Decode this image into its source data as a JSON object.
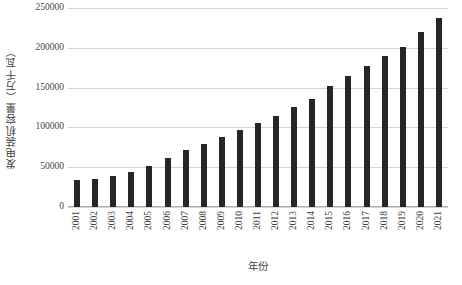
{
  "chart_data": {
    "type": "bar",
    "title": "",
    "xlabel": "年份",
    "ylabel": "发电装机容量（万千瓦）",
    "categories": [
      "2001",
      "2002",
      "2003",
      "2004",
      "2005",
      "2006",
      "2007",
      "2008",
      "2009",
      "2010",
      "2011",
      "2012",
      "2013",
      "2014",
      "2015",
      "2016",
      "2017",
      "2018",
      "2019",
      "2020",
      "2021"
    ],
    "values": [
      33900,
      35700,
      39100,
      44400,
      51700,
      62200,
      71800,
      79300,
      87400,
      96600,
      106000,
      114700,
      125800,
      136000,
      152100,
      165100,
      177700,
      190000,
      201000,
      220000,
      237700
    ],
    "ylim": [
      0,
      250000
    ],
    "y_ticks": [
      0,
      50000,
      100000,
      150000,
      200000,
      250000
    ],
    "y_tick_labels": [
      "0",
      "50000",
      "100000",
      "150000",
      "200000",
      "250000"
    ],
    "grid": true,
    "legend": "none",
    "bar_color": "#262626",
    "gridline_color": "#d4d4d4",
    "axis_color": "#b0b0b0",
    "text_color": "#3f3f3f",
    "background": "#ffffff"
  }
}
